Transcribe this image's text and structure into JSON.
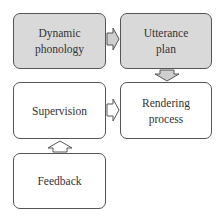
{
  "diagram": {
    "nodes": [
      {
        "id": "dynamic-phonology",
        "label_lines": [
          "Dynamic",
          "phonology"
        ],
        "fill": "#d9d9d9"
      },
      {
        "id": "utterance-plan",
        "label_lines": [
          "Utterance",
          "plan"
        ],
        "fill": "#d9d9d9"
      },
      {
        "id": "supervision",
        "label_lines": [
          "Supervision"
        ],
        "fill": "#ffffff"
      },
      {
        "id": "rendering-process",
        "label_lines": [
          "Rendering",
          "process"
        ],
        "fill": "#ffffff"
      },
      {
        "id": "feedback",
        "label_lines": [
          "Feedback"
        ],
        "fill": "#ffffff"
      }
    ],
    "edges": [
      {
        "from": "dynamic-phonology",
        "to": "utterance-plan",
        "direction": "right"
      },
      {
        "from": "utterance-plan",
        "to": "rendering-process",
        "direction": "down"
      },
      {
        "from": "supervision",
        "to": "rendering-process",
        "direction": "right"
      },
      {
        "from": "feedback",
        "to": "supervision",
        "direction": "up"
      }
    ],
    "colors": {
      "gray_fill": "#d9d9d9",
      "border": "#555555",
      "arrow_fill_gray": "#cfcfcf"
    }
  }
}
